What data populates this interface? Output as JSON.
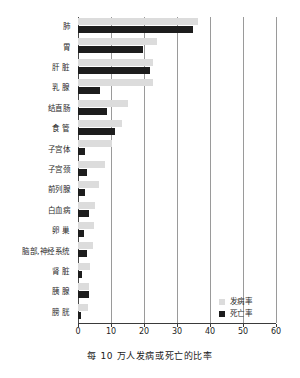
{
  "chart_data": {
    "type": "bar",
    "orientation": "horizontal",
    "title": "",
    "xlabel": "每 10 万人发病或死亡的比率",
    "ylabel": "",
    "xlim": [
      0,
      60
    ],
    "xticks": [
      0,
      10,
      20,
      30,
      40,
      50,
      60
    ],
    "xtick_labels": [
      "0",
      "10",
      "20",
      "30",
      "40",
      "50",
      "60"
    ],
    "grid": true,
    "grid_axis": "x",
    "legend_position": "bottom-right",
    "categories": [
      "肺",
      "胃",
      "肝 脏",
      "乳 腺",
      "结直肠",
      "食 管",
      "子宫体",
      "子宫颈",
      "前列腺",
      "白血病",
      "卵 巢",
      "脑部,神经系统",
      "肾 脏",
      "胰 腺",
      "膀 胱"
    ],
    "series": [
      {
        "name": "发病率",
        "color": "#dcdcdc",
        "values": [
          36.4,
          24.0,
          22.8,
          22.7,
          15.2,
          13.3,
          10.3,
          8.2,
          6.4,
          5.0,
          4.8,
          4.4,
          3.6,
          3.4,
          3.0
        ]
      },
      {
        "name": "死亡率",
        "color": "#1d1d1d",
        "values": [
          34.8,
          19.7,
          21.8,
          6.7,
          8.8,
          11.2,
          2.1,
          2.7,
          2.1,
          3.3,
          1.7,
          2.6,
          1.2,
          3.2,
          1.0
        ]
      }
    ]
  },
  "legend": {
    "items": [
      {
        "label": "发病率",
        "swatch": "incidence"
      },
      {
        "label": "死亡率",
        "swatch": "mortality"
      }
    ]
  }
}
